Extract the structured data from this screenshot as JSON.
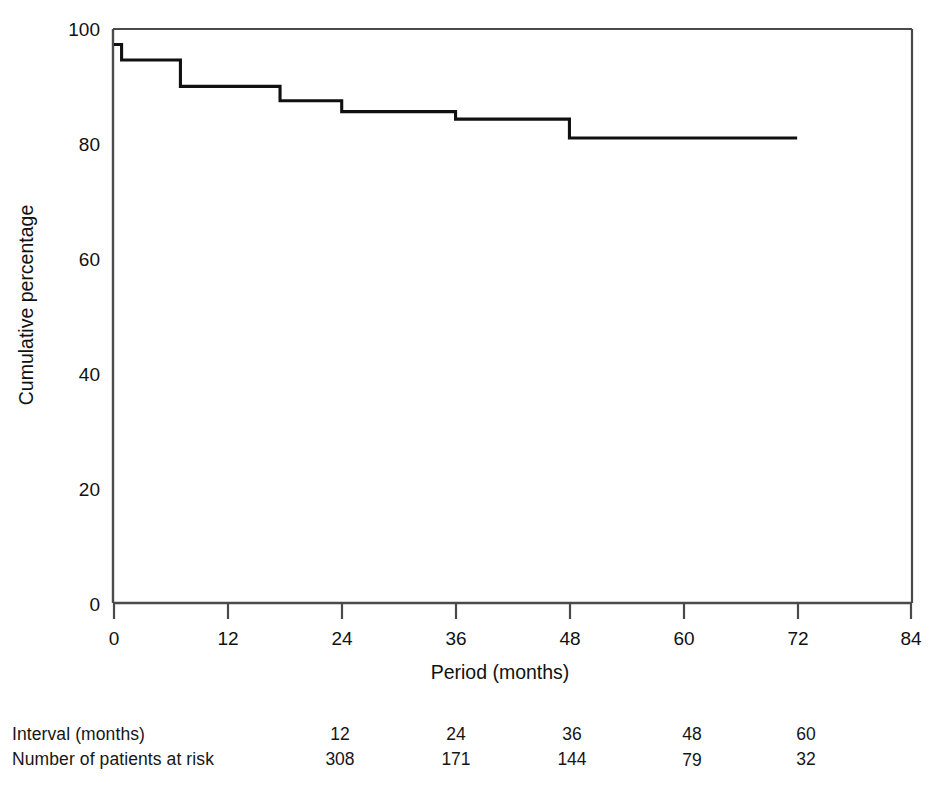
{
  "chart_data": {
    "type": "line",
    "subtype": "kaplan-meier-step",
    "title": "",
    "xlabel": "Period (months)",
    "ylabel": "Cumulative percentage",
    "xlim": [
      0,
      84
    ],
    "ylim": [
      0,
      100
    ],
    "xticks": [
      0,
      12,
      24,
      36,
      48,
      60,
      72,
      84
    ],
    "xticklabels": [
      "0",
      "12",
      "24",
      "36",
      "48",
      "60",
      "72",
      "84"
    ],
    "yticks": [
      0,
      20,
      40,
      60,
      80,
      100
    ],
    "yticklabels": [
      "0",
      "20",
      "40",
      "60",
      "80",
      "100"
    ],
    "grid": false,
    "legend": null,
    "line_color": "#101010",
    "series": [
      {
        "name": "Cumulative percentage",
        "step": "post",
        "x": [
          0,
          0.8,
          3.2,
          6.3,
          7.0,
          13.0,
          17.5,
          18.2,
          24.0,
          24.6,
          36.0,
          36.6,
          48.0,
          48.6,
          72.0
        ],
        "y": [
          97.3,
          94.6,
          94.6,
          94.6,
          90.0,
          90.0,
          90.0,
          87.5,
          87.5,
          85.6,
          85.6,
          84.3,
          84.3,
          81.0,
          81.0
        ],
        "steps": [
          {
            "x_start": 0,
            "x_end": 0.8,
            "y": 97.3
          },
          {
            "x_start": 0.8,
            "x_end": 7.0,
            "y": 94.6
          },
          {
            "x_start": 7.0,
            "x_end": 17.5,
            "y": 90.0
          },
          {
            "x_start": 17.5,
            "x_end": 24.0,
            "y": 87.5
          },
          {
            "x_start": 24.0,
            "x_end": 36.0,
            "y": 85.6
          },
          {
            "x_start": 36.0,
            "x_end": 48.0,
            "y": 84.3
          },
          {
            "x_start": 48.0,
            "x_end": 72.0,
            "y": 81.0
          }
        ]
      }
    ]
  },
  "risk_table": {
    "row_labels": [
      "Interval (months)",
      "Number of patients at risk"
    ],
    "intervals": [
      "12",
      "24",
      "36",
      "48",
      "60"
    ],
    "at_risk": [
      "308",
      "171",
      "144",
      "79",
      "32"
    ]
  },
  "axis": {
    "x_label": "Period (months)",
    "y_label": "Cumulative percentage",
    "x_tick_0": "0",
    "x_tick_1": "12",
    "x_tick_2": "24",
    "x_tick_3": "36",
    "x_tick_4": "48",
    "x_tick_5": "60",
    "x_tick_6": "72",
    "x_tick_7": "84",
    "y_tick_0": "0",
    "y_tick_1": "20",
    "y_tick_2": "40",
    "y_tick_3": "60",
    "y_tick_4": "80",
    "y_tick_5": "100"
  }
}
